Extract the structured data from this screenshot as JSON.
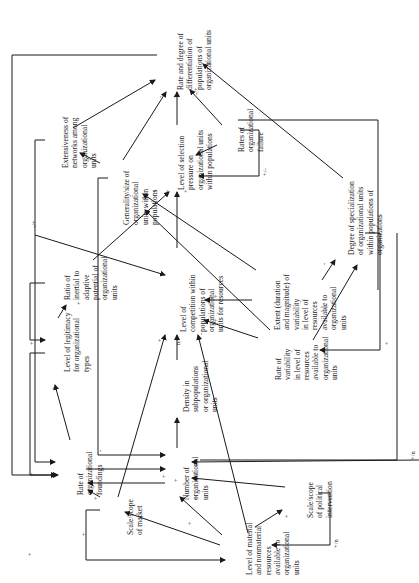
{
  "diagram": {
    "orientation": "rotated -90deg (text reads bottom-to-top)",
    "nodes": {
      "rate_diff": {
        "label": "Rate and degree of\ndifferentiation of\npopulations of\norganizational units"
      },
      "networks": {
        "label": "Extensiveness of\nnetworks among\norganizational\nunits"
      },
      "generality": {
        "label": "Generality/size of\norganizational\nunits within\npopulations"
      },
      "selection": {
        "label": "Level of selection\npressure on\norganizational units\nwithin populations"
      },
      "failure": {
        "label": "Rates of\norganizational\nfailure"
      },
      "specialization": {
        "label": "Degree of specialization\nof organizational units\nwithin populations of\norganizations"
      },
      "inertia": {
        "label": "Ratio of\ninertial to\nadaptive\npotential of\norganizational\nunits"
      },
      "legitimacy": {
        "label": "Level of legitimacy\nfor organizational\ntypes"
      },
      "competition": {
        "label": "Level of\ncompetition within\npopulations of\norganizational\nunits for resources"
      },
      "extent_var": {
        "label": "Extent (duration\nand magnitude) of\nvariability\nin level of\nresources\navailable to\norganizational\nunits"
      },
      "rate_var": {
        "label": "Rate of\nvariability\nin level of\nresources\navailable to\norganizational\nunits"
      },
      "density": {
        "label": "Density in\nsubpopulations\nor organizational\nunits"
      },
      "foundings": {
        "label": "Rate of\norganizational\nfoundings"
      },
      "number": {
        "label": "Number of\norganizational\nunits"
      },
      "market": {
        "label": "Scale/scope\nof market"
      },
      "resources": {
        "label": "Level of material\nand nonmaterial\nresources\navailable to\norganizational\nunits"
      },
      "political": {
        "label": "Scale/scope\nof political\nintervention"
      }
    },
    "signs": [
      {
        "text": "-",
        "x": 150,
        "y": 82
      },
      {
        "text": "-",
        "x": 156,
        "y": 98
      },
      {
        "text": "+",
        "x": 171,
        "y": 98
      },
      {
        "text": "+",
        "x": 206,
        "y": 65
      },
      {
        "text": "-/+",
        "x": 192,
        "y": 95
      },
      {
        "text": "+/-",
        "x": 261,
        "y": 176
      },
      {
        "text": "+",
        "x": 197,
        "y": 152
      },
      {
        "text": "-",
        "x": 82,
        "y": 152
      },
      {
        "text": "+",
        "x": 151,
        "y": 193
      },
      {
        "text": "+",
        "x": 164,
        "y": 193
      },
      {
        "text": "+",
        "x": 182,
        "y": 193
      },
      {
        "text": "-",
        "x": 143,
        "y": 208
      },
      {
        "text": "-/+",
        "x": 30,
        "y": 228
      },
      {
        "text": "+",
        "x": 75,
        "y": 305
      },
      {
        "text": "+",
        "x": 28,
        "y": 345
      },
      {
        "text": "+",
        "x": 50,
        "y": 390
      },
      {
        "text": "+",
        "x": 156,
        "y": 342
      },
      {
        "text": "n/+",
        "x": 174,
        "y": 345
      },
      {
        "text": "-",
        "x": 197,
        "y": 335
      },
      {
        "text": "+",
        "x": 212,
        "y": 298
      },
      {
        "text": "+",
        "x": 212,
        "y": 322
      },
      {
        "text": "-",
        "x": 320,
        "y": 265
      },
      {
        "text": "+/-",
        "x": 322,
        "y": 312
      },
      {
        "text": "+",
        "x": 383,
        "y": 345
      },
      {
        "text": "+",
        "x": 28,
        "y": 476
      },
      {
        "text": "+",
        "x": 26,
        "y": 556
      },
      {
        "text": "+",
        "x": 80,
        "y": 536
      },
      {
        "text": "+",
        "x": 88,
        "y": 484
      },
      {
        "text": "+",
        "x": 92,
        "y": 500
      },
      {
        "text": "+",
        "x": 160,
        "y": 478
      },
      {
        "text": "+",
        "x": 172,
        "y": 482
      },
      {
        "text": "+",
        "x": 192,
        "y": 500
      },
      {
        "text": "+",
        "x": 186,
        "y": 525
      },
      {
        "text": "+",
        "x": 138,
        "y": 518
      },
      {
        "text": "+",
        "x": 283,
        "y": 518
      },
      {
        "text": "+/n",
        "x": 332,
        "y": 548
      },
      {
        "text": "+/n",
        "x": 409,
        "y": 460
      },
      {
        "text": "-",
        "x": 96,
        "y": 452
      }
    ]
  }
}
